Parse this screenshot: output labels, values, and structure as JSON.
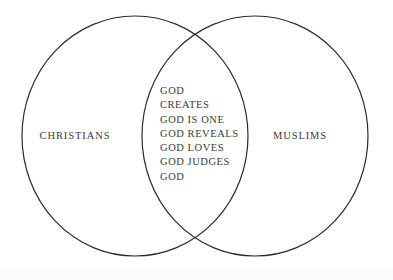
{
  "diagram": {
    "type": "venn",
    "title": "",
    "background_color": "#ffffff",
    "stroke_color": "#2b2b2b",
    "text_color": "#3a3a3a",
    "sets": [
      {
        "id": "christians",
        "label": "CHRISTIANS",
        "position": "left"
      },
      {
        "id": "muslims",
        "label": "MUSLIMS",
        "position": "right"
      }
    ],
    "intersection": {
      "id": "shared-beliefs",
      "items": [
        "GOD",
        "CREATES",
        "GOD IS ONE",
        "GOD REVEALS",
        "GOD LOVES",
        "GOD JUDGES",
        "GOD"
      ]
    }
  }
}
